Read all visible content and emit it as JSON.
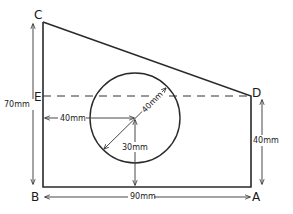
{
  "diagram": {
    "type": "engineering-drawing",
    "vertices": {
      "A": "A",
      "B": "B",
      "C": "C",
      "D": "D",
      "E": "E"
    },
    "dimensions": {
      "height_BC": "70mm",
      "height_AD": "40mm",
      "width_BA": "90mm",
      "hole_x_from_left": "40mm",
      "hole_y_from_bottom": "30mm",
      "hole_diameter": "40mm"
    }
  }
}
